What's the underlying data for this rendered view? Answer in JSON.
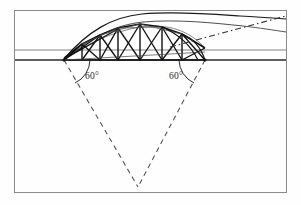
{
  "figure": {
    "background_color": "#fefefe",
    "ink_color": "#1a1a1a",
    "light_ink_color": "#6b6b6b"
  },
  "frame": {
    "name": "outer-border",
    "x": 14,
    "y": 10,
    "width": 273,
    "height": 183,
    "stroke": "#8a8a8a"
  },
  "ground": {
    "upper_line_y": 50,
    "lower_line_y": 60,
    "left_x": 14,
    "right_x": 287,
    "stroke": "#4a4a4a",
    "band_label": "ground-band"
  },
  "supports": {
    "left": {
      "x": 64,
      "y": 60,
      "label": "left-springing-point"
    },
    "right": {
      "x": 205,
      "y": 60,
      "label": "right-springing-point"
    }
  },
  "arch": {
    "crown_x": 140,
    "crown_y": 16,
    "inner_crown_y": 23,
    "extension_end_x": 287,
    "extension_end_y": 12
  },
  "annotations": [
    {
      "id": "angle-left",
      "text": "60°",
      "x": 92,
      "y": 77,
      "arc_center_x": 64,
      "arc_radius": 26
    },
    {
      "id": "angle-right",
      "text": "60°",
      "x": 176,
      "y": 77,
      "arc_center_x": 205,
      "arc_radius": 26
    }
  ],
  "construction_lines": {
    "style": "dashed",
    "apex": {
      "x": 138,
      "y": 187
    },
    "left_start": {
      "x": 64,
      "y": 60
    },
    "right_start": {
      "x": 205,
      "y": 60
    },
    "dash_pattern": "5 4",
    "stroke": "#555555"
  },
  "tangent_line": {
    "style": "dash-dot",
    "start_x": 170,
    "start_y": 46,
    "end_x": 287,
    "end_y": 16,
    "dash_pattern": "6 3 1.5 3"
  },
  "truss": {
    "panel_count": 8,
    "bottom_chord_label": "bottom-chord",
    "top_chord_label": "top-chord-curve",
    "verticals_label": "vertical-web-members",
    "diagonals_label": "diagonal-web-members",
    "bottom_nodes_x": [
      64,
      82,
      100,
      118,
      140,
      162,
      182,
      205
    ],
    "top_nodes": [
      {
        "x": 64,
        "y": 58
      },
      {
        "x": 82,
        "y": 44
      },
      {
        "x": 100,
        "y": 35
      },
      {
        "x": 118,
        "y": 28
      },
      {
        "x": 140,
        "y": 24
      },
      {
        "x": 162,
        "y": 27
      },
      {
        "x": 182,
        "y": 34
      },
      {
        "x": 205,
        "y": 48
      }
    ]
  }
}
